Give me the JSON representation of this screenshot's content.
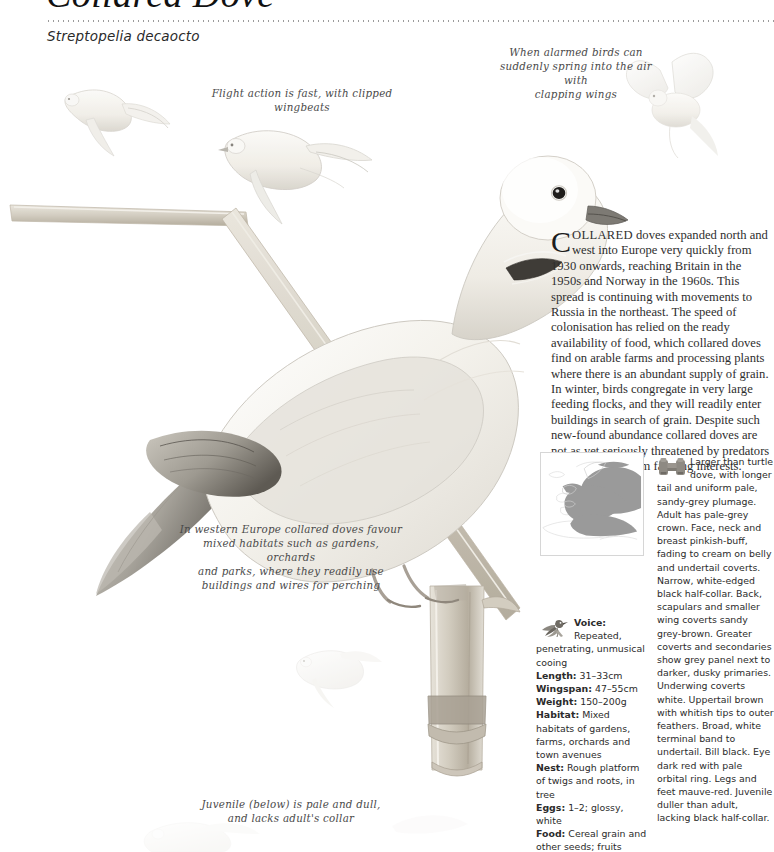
{
  "header": {
    "common_name": "Collared Dove",
    "scientific_name": "Streptopelia decaocto",
    "divider": "dotted-rule"
  },
  "annotations": [
    {
      "id": "flight",
      "text": "Flight action is fast, with clipped wingbeats"
    },
    {
      "id": "alarm",
      "text": "When alarmed birds can\nsuddenly spring into the air with\nclapping wings"
    },
    {
      "id": "habitat",
      "text": "In western Europe collared doves favour\nmixed habitats such as gardens, orchards\nand parks, where they readily use\nbuildings and wires for perching"
    },
    {
      "id": "juvenile",
      "text": "Juvenile (below) is pale and dull,\nand lacks adult's collar"
    }
  ],
  "essay": {
    "dropcap": "C",
    "smallcaps_opening": "OLLARED",
    "body": " doves expanded north and west into Europe very quickly from 1930 onwards, reaching Britain in the 1950s and Norway in the 1960s. This spread is continuing with movements to Russia in the northeast. The speed of colonisation has relied on the ready availability of food, which collared doves find on arable farms and processing plants where there is an abundant supply of grain. In winter, birds congregate in very large feeding flocks, and they will readily enter buildings in search of grain. Despite such new-found abundance collared doves are not as yet seriously threatened by predators or persecution from farming interests."
  },
  "map": {
    "caption": "Europe distribution map",
    "range_fill": "#9a9a9a",
    "coast_stroke": "#d9d9d9",
    "background": "#ffffff"
  },
  "facts": {
    "icon": "songbird-icon",
    "entries": [
      {
        "label": "Voice:",
        "value": "Repeated, penetrating, unmusical cooing"
      },
      {
        "label": "Length:",
        "value": "31–33cm"
      },
      {
        "label": "Wingspan:",
        "value": "47–55cm"
      },
      {
        "label": "Weight:",
        "value": "150–200g"
      },
      {
        "label": "Habitat:",
        "value": "Mixed habitats of gardens, farms, orchards and town avenues"
      },
      {
        "label": "Nest:",
        "value": "Rough platform of twigs and roots, in tree"
      },
      {
        "label": "Eggs:",
        "value": "1–2; glossy, white"
      },
      {
        "label": "Food:",
        "value": "Cereal grain and other seeds; fruits"
      }
    ]
  },
  "identification": {
    "icon": "binoculars-icon",
    "text": "Larger than turtle dove, with longer tail and uniform pale, sandy-grey plumage. Adult has pale-grey crown. Face, neck and breast pinkish-buff, fading to cream on belly and undertail coverts. Narrow, white-edged black half-collar. Back, scapulars and smaller wing coverts sandy grey-brown. Greater coverts and secondaries show grey panel next to darker, dusky primaries. Underwing coverts white. Uppertail brown with whitish tips to outer feathers. Broad, white terminal band to undertail. Bill black. Eye dark red with pale orbital ring. Legs and feet mauve-red. Juvenile duller than adult, lacking black half-collar."
  },
  "illustration": {
    "subjects": [
      {
        "name": "flying-dove-upper-left",
        "description": "Dove in flight, wings raised"
      },
      {
        "name": "flying-dove-center-left",
        "description": "Dove in flight, wings spread"
      },
      {
        "name": "flying-dove-top-right",
        "description": "Dove springing into air with clapping wings"
      },
      {
        "name": "perched-adult-dove",
        "description": "Main adult collared dove perched on wooden post"
      },
      {
        "name": "juvenile-dove",
        "description": "Small pale juvenile dove in flight, lower area"
      },
      {
        "name": "wooden-post",
        "description": "Wooden fence post with angled rails"
      }
    ],
    "palette": {
      "plumage_cream": "#f3f0ea",
      "plumage_grey": "#d9d6cf",
      "wing_dark": "#6f6a62",
      "post_wood": "#cfc9bd",
      "post_shadow": "#a49c8e",
      "eye_dark": "#2b2b2b"
    }
  }
}
